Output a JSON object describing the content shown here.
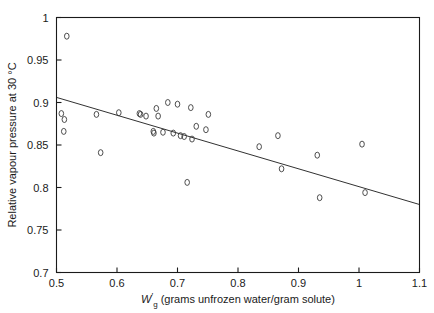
{
  "chart_data": {
    "type": "scatter",
    "title": "",
    "xlabel": "W'g (grams unfrozen water/gram solute)",
    "xlabel_parts": {
      "symbol": "W",
      "prime": "′",
      "subscript": "g",
      "rest": "(grams unfrozen water/gram solute)"
    },
    "ylabel": "Relative vapour pressure at 30 °C",
    "xlim": [
      0.5,
      1.1
    ],
    "ylim": [
      0.7,
      1.0
    ],
    "xticks": [
      0.5,
      0.6,
      0.7,
      0.8,
      0.9,
      1.0,
      1.1
    ],
    "xticklabels": [
      "0.5",
      "0.6",
      "0.7",
      "0.8",
      "0.9",
      "1",
      "1.1"
    ],
    "yticks": [
      0.7,
      0.75,
      0.8,
      0.85,
      0.9,
      0.95,
      1.0
    ],
    "yticklabels": [
      "0.7",
      "0.75",
      "0.8",
      "0.85",
      "0.9",
      "0.95",
      "1"
    ],
    "grid": false,
    "legend": null,
    "marker": "open-circle",
    "series": [
      {
        "name": "samples",
        "x": [
          0.517,
          0.508,
          0.513,
          0.512,
          0.566,
          0.573,
          0.603,
          0.637,
          0.639,
          0.648,
          0.66,
          0.661,
          0.665,
          0.668,
          0.676,
          0.684,
          0.693,
          0.7,
          0.705,
          0.711,
          0.716,
          0.722,
          0.724,
          0.731,
          0.747,
          0.751,
          0.835,
          0.866,
          0.872,
          0.931,
          0.935,
          1.005,
          1.01
        ],
        "y": [
          0.978,
          0.887,
          0.88,
          0.866,
          0.886,
          0.841,
          0.888,
          0.887,
          0.886,
          0.884,
          0.866,
          0.864,
          0.893,
          0.884,
          0.865,
          0.9,
          0.864,
          0.898,
          0.861,
          0.86,
          0.806,
          0.894,
          0.857,
          0.872,
          0.868,
          0.886,
          0.848,
          0.861,
          0.822,
          0.838,
          0.788,
          0.851,
          0.794
        ]
      }
    ],
    "fit_line": {
      "type": "linear",
      "x": [
        0.5,
        1.1
      ],
      "y": [
        0.906,
        0.78
      ]
    }
  },
  "figure": {
    "background_color": "#ffffff",
    "foreground_color": "#1a1a1a"
  }
}
